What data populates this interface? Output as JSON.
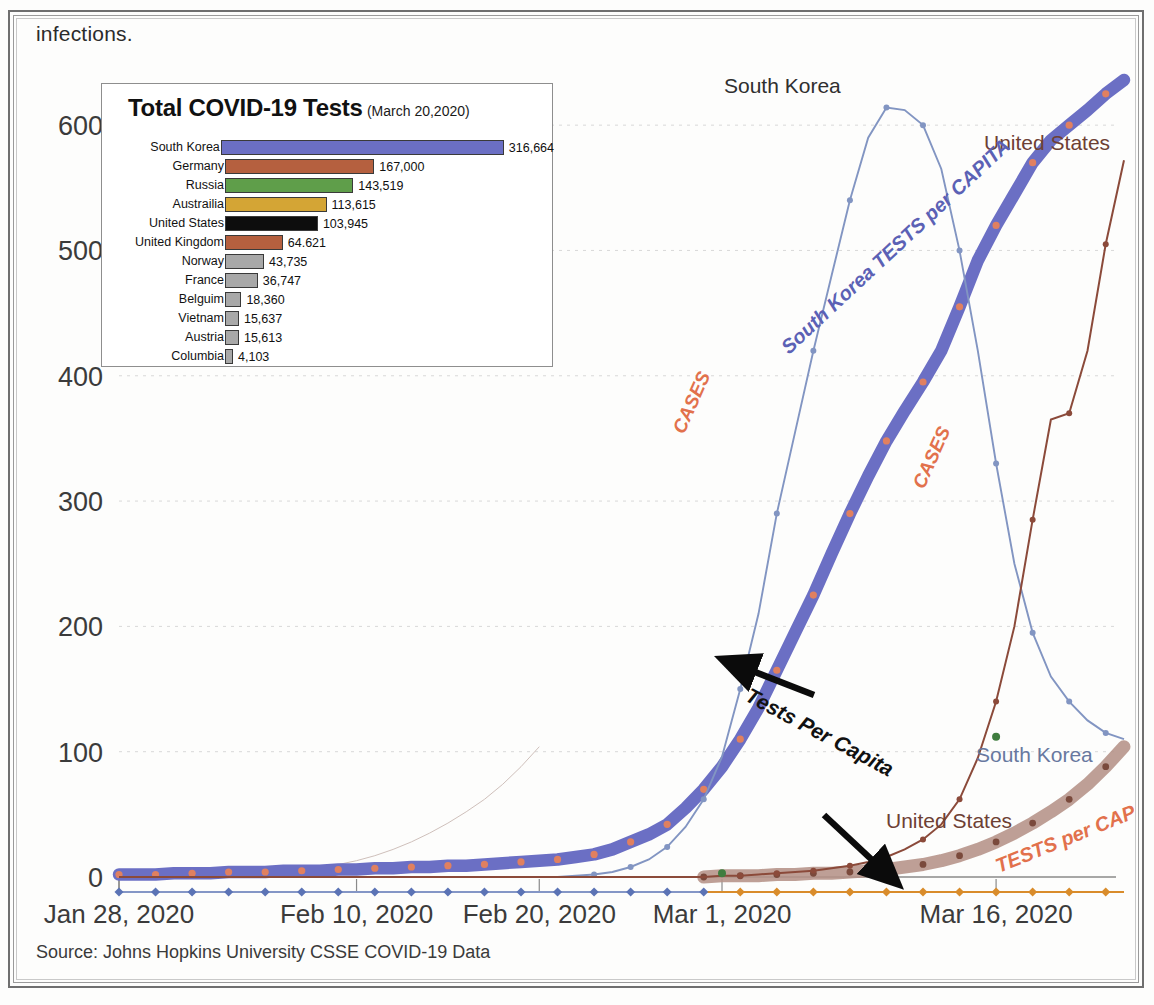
{
  "page": {
    "top_text": "infections.",
    "source": "Source: Johns Hopkins University CSSE COVID-19 Data"
  },
  "inset": {
    "title": "Total COVID-19 Tests",
    "subtitle": "(March 20,2020)",
    "max_value": 316664,
    "bars": [
      {
        "country": "South Korea",
        "value": 316664,
        "label": "316,664",
        "color": "#6b6fc4"
      },
      {
        "country": "Germany",
        "value": 167000,
        "label": "167,000",
        "color": "#b5603f"
      },
      {
        "country": "Russia",
        "value": 143519,
        "label": "143,519",
        "color": "#5f9e4a"
      },
      {
        "country": "Austrailia",
        "value": 113615,
        "label": "113,615",
        "color": "#d4a535"
      },
      {
        "country": "United States",
        "value": 103945,
        "label": "103,945",
        "color": "#0d0d0d"
      },
      {
        "country": "United Kingdom",
        "value": 64621,
        "label": "64.621",
        "color": "#b5603f"
      },
      {
        "country": "Norway",
        "value": 43735,
        "label": "43,735",
        "color": "#a8a8a8"
      },
      {
        "country": "France",
        "value": 36747,
        "label": "36,747",
        "color": "#a8a8a8"
      },
      {
        "country": "Belguim",
        "value": 18360,
        "label": "18,360",
        "color": "#a8a8a8"
      },
      {
        "country": "Vietnam",
        "value": 15637,
        "label": "15,637",
        "color": "#a8a8a8"
      },
      {
        "country": "Austria",
        "value": 15613,
        "label": "15,613",
        "color": "#a8a8a8"
      },
      {
        "country": "Columbia",
        "value": 4103,
        "label": "4,103",
        "color": "#a8a8a8"
      }
    ]
  },
  "annotations": {
    "sk_top": "South Korea",
    "sk_right": "South Korea",
    "us_top": "United States",
    "us_low": "United States",
    "cases_left": "CASES",
    "cases_right": "CASES",
    "sk_tests_per_capita": "South Korea TESTS per CAPITA",
    "us_tests_per_capita": "TESTS per CAPITA",
    "arrow_label": "Tests Per Capita"
  },
  "colors": {
    "sk_cases": "#8295c2",
    "sk_tests": "#6b6fc4",
    "sk_tests_marker": "#e08060",
    "us_cases": "#8b4a3a",
    "us_tests": "#b59287",
    "bottom_blue": "#5b73b5",
    "bottom_orange": "#d98c2b",
    "axis": "#8a8a8a",
    "grid": "#d8d8d8"
  },
  "chart_data": {
    "type": "line",
    "title": "",
    "xlabel": "",
    "ylabel": "",
    "ylim": [
      0,
      640
    ],
    "grid": true,
    "legend": "annotations on curves",
    "y_ticks": [
      0,
      100,
      200,
      300,
      400,
      500,
      600
    ],
    "x_ticks": [
      "Jan 28, 2020",
      "Feb 10, 2020",
      "Feb 20, 2020",
      "Mar 1, 2020",
      "Mar 16, 2020"
    ],
    "x_tick_index": [
      0,
      13,
      23,
      33,
      48
    ],
    "n_points": 56,
    "series": [
      {
        "name": "South Korea CASES",
        "color": "#8295c2",
        "values": [
          0,
          0,
          0,
          0,
          0,
          0,
          0,
          0,
          0,
          0,
          0,
          0,
          0,
          0,
          0,
          0,
          0,
          0,
          0,
          0,
          0,
          0,
          0,
          0,
          0,
          1,
          2,
          4,
          8,
          14,
          24,
          40,
          62,
          96,
          150,
          210,
          290,
          355,
          420,
          480,
          540,
          590,
          614,
          612,
          600,
          565,
          500,
          420,
          330,
          250,
          195,
          160,
          140,
          125,
          115,
          110
        ]
      },
      {
        "name": "South Korea TESTS per CAPITA",
        "color": "#6b6fc4",
        "marker_color": "#e08060",
        "values": [
          2,
          2,
          2,
          3,
          3,
          3,
          4,
          4,
          4,
          5,
          5,
          5,
          6,
          6,
          7,
          7,
          8,
          8,
          9,
          9,
          10,
          11,
          12,
          13,
          14,
          16,
          18,
          22,
          28,
          34,
          42,
          55,
          70,
          88,
          110,
          135,
          165,
          195,
          225,
          258,
          290,
          320,
          348,
          372,
          395,
          420,
          455,
          492,
          520,
          545,
          570,
          588,
          600,
          612,
          625,
          636
        ]
      },
      {
        "name": "United States CASES",
        "color": "#8b4a3a",
        "values": [
          0,
          0,
          0,
          0,
          0,
          0,
          0,
          0,
          0,
          0,
          0,
          0,
          0,
          0,
          0,
          0,
          0,
          0,
          0,
          0,
          0,
          0,
          0,
          0,
          0,
          0,
          0,
          0,
          0,
          0,
          0,
          0,
          0,
          1,
          1,
          2,
          3,
          4,
          5,
          7,
          9,
          12,
          16,
          22,
          30,
          42,
          62,
          95,
          140,
          200,
          285,
          365,
          370,
          420,
          505,
          572
        ]
      },
      {
        "name": "United States TESTS per CAPITA",
        "color": "#b59287",
        "values": [
          0,
          0,
          0,
          0,
          0,
          0,
          0,
          0,
          0,
          0,
          0,
          0,
          0,
          0,
          0,
          0,
          0,
          0,
          0,
          0,
          0,
          0,
          0,
          0,
          0,
          0,
          0,
          0,
          0,
          0,
          0,
          0,
          0,
          1,
          1,
          1,
          2,
          2,
          3,
          3,
          4,
          5,
          6,
          8,
          10,
          13,
          17,
          22,
          28,
          35,
          43,
          52,
          62,
          74,
          88,
          104
        ]
      },
      {
        "name": "baseline blue/orange series",
        "color": "#5b73b5",
        "values": [
          -12,
          -12,
          -12,
          -12,
          -12,
          -12,
          -12,
          -12,
          -12,
          -12,
          -12,
          -12,
          -12,
          -12,
          -12,
          -12,
          -12,
          -12,
          -12,
          -12,
          -12,
          -12,
          -12,
          -12,
          -12,
          -12,
          -12,
          -12,
          -12,
          -12,
          -12,
          -12,
          -12,
          -12,
          -12,
          -12,
          -12,
          -12,
          -12,
          -12,
          -12,
          -12,
          -12,
          -12,
          -12,
          -12,
          -12,
          -12,
          -12,
          -12,
          -12,
          -12,
          -12,
          -12,
          -12,
          -12
        ]
      }
    ]
  }
}
